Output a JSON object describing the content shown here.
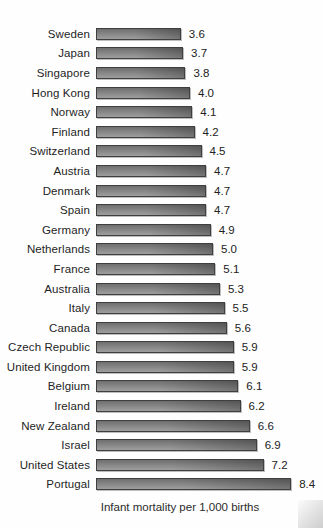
{
  "chart_data": {
    "type": "bar",
    "orientation": "horizontal",
    "title": "",
    "xlabel": "Infant mortality per 1,000 births",
    "ylabel": "",
    "xlim": [
      0,
      8.4
    ],
    "grid": false,
    "legend": false,
    "categories": [
      "Sweden",
      "Japan",
      "Singapore",
      "Hong Kong",
      "Norway",
      "Finland",
      "Switzerland",
      "Austria",
      "Denmark",
      "Spain",
      "Germany",
      "Netherlands",
      "France",
      "Australia",
      "Italy",
      "Canada",
      "Czech Republic",
      "United Kingdom",
      "Belgium",
      "Ireland",
      "New Zealand",
      "Israel",
      "United States",
      "Portugal"
    ],
    "values": [
      3.6,
      3.7,
      3.8,
      4.0,
      4.1,
      4.2,
      4.5,
      4.7,
      4.7,
      4.7,
      4.9,
      5.0,
      5.1,
      5.3,
      5.5,
      5.6,
      5.9,
      5.9,
      6.1,
      6.2,
      6.6,
      6.9,
      7.2,
      8.4
    ],
    "value_labels": [
      "3.6",
      "3.7",
      "3.8",
      "4.0",
      "4.1",
      "4.2",
      "4.5",
      "4.7",
      "4.7",
      "4.7",
      "4.9",
      "5.0",
      "5.1",
      "5.3",
      "5.5",
      "5.6",
      "5.9",
      "5.9",
      "6.1",
      "6.2",
      "6.6",
      "6.9",
      "7.2",
      "8.4"
    ],
    "colors": {
      "bar_gradient_light": "#9e9e9e",
      "bar_gradient_dark": "#6f6f6f",
      "bar_border": "#3f3f3f",
      "text": "#222222",
      "background": "#fefefe"
    }
  }
}
